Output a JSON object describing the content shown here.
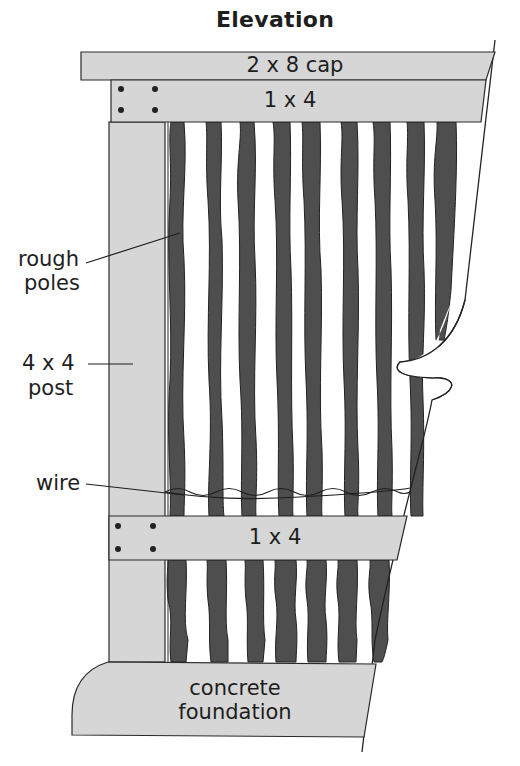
{
  "title": "Elevation",
  "labels": {
    "cap": "2 x 8 cap",
    "upper_rail": "1 x 4",
    "lower_rail": "1 x 4",
    "rough_poles_line1": "rough",
    "rough_poles_line2": "poles",
    "post_line1": "4 x 4",
    "post_line2": "post",
    "wire": "wire",
    "foundation_line1": "concrete",
    "foundation_line2": "foundation"
  },
  "colors": {
    "lumber_fill": "#d6d6d6",
    "pole_fill": "#4e4e4e",
    "outline": "#2a2a2a",
    "background": "#ffffff"
  },
  "components": [
    "2 x 8 cap",
    "1 x 4 upper rail",
    "rough poles",
    "4 x 4 post",
    "wire",
    "1 x 4 lower rail",
    "concrete foundation"
  ]
}
